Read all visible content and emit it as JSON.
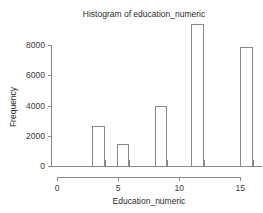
{
  "chart_data": {
    "type": "bar",
    "title": "Histogram of education_numeric",
    "xlabel": "Education_numeric",
    "ylabel": "Frequency",
    "grid": false,
    "legend": null,
    "xlim": [
      0,
      16
    ],
    "ylim": [
      0,
      9400
    ],
    "xticks": [
      "0",
      "5",
      "10",
      "15"
    ],
    "xtick_values": [
      0,
      5,
      10,
      15
    ],
    "yticks": [
      "0",
      "2000",
      "4000",
      "6000",
      "8000"
    ],
    "ytick_values": [
      0,
      2000,
      4000,
      6000,
      8000
    ],
    "bin_edges": [
      2.9,
      3.9,
      4.9,
      5.9,
      8.0,
      9.0,
      11.0,
      12.0,
      15.0,
      16.0
    ],
    "bars": [
      {
        "label": "3",
        "x0": 2.9,
        "x1": 3.9,
        "value": 2640
      },
      {
        "label": "5",
        "x0": 4.9,
        "x1": 5.9,
        "value": 1460
      },
      {
        "label": "8",
        "x0": 8.0,
        "x1": 9.0,
        "value": 4000
      },
      {
        "label": "11",
        "x0": 11.0,
        "x1": 12.0,
        "value": 9400
      },
      {
        "label": "15",
        "x0": 15.0,
        "x1": 16.0,
        "value": 7880
      }
    ],
    "categories": [
      "3",
      "5",
      "8",
      "11",
      "15"
    ],
    "values": [
      2640,
      1460,
      4000,
      9400,
      7880
    ]
  },
  "style": {
    "background": "#ffffff",
    "axis_color": "#888888",
    "bar_stroke": "#8a8a8a",
    "bar_fill": "#ffffff",
    "text_color": "#2b2b2b"
  }
}
